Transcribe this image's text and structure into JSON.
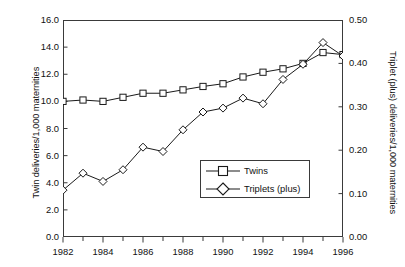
{
  "chart_data": {
    "type": "line",
    "title": "",
    "subtitle": "",
    "xlabel": "",
    "ylabel": "Twin deliveries/1,000 maternities",
    "y2label": "Triplet (plus) deliveries/1,000 maternities",
    "x": [
      1982,
      1983,
      1984,
      1985,
      1986,
      1987,
      1988,
      1989,
      1990,
      1991,
      1992,
      1993,
      1994,
      1995,
      1996
    ],
    "xlim": [
      1982,
      1996
    ],
    "ylim": [
      0.0,
      16.0
    ],
    "y2lim": [
      0.0,
      0.5
    ],
    "grid": false,
    "legend_position": "center-right-inside",
    "x_tick_labels": [
      "1982",
      "1984",
      "1986",
      "1988",
      "1990",
      "1992",
      "1994",
      "1996"
    ],
    "x_tick_values": [
      1982,
      1984,
      1986,
      1988,
      1990,
      1992,
      1994,
      1996
    ],
    "x_minor_tick_values": [
      1983,
      1985,
      1987,
      1989,
      1991,
      1993,
      1995
    ],
    "y_tick_labels": [
      "16.0",
      "14.0",
      "12.0",
      "10.0",
      "8.0",
      "6.0",
      "4.0",
      "2.0",
      "0.0"
    ],
    "y_tick_values": [
      16.0,
      14.0,
      12.0,
      10.0,
      8.0,
      6.0,
      4.0,
      2.0,
      0.0
    ],
    "y2_tick_labels": [
      "0.50",
      "0.40",
      "0.30",
      "0.20",
      "0.10",
      "0.00"
    ],
    "y2_tick_values": [
      0.5,
      0.4,
      0.3,
      0.2,
      0.1,
      0.0
    ],
    "series": [
      {
        "name": "Twins",
        "axis": "left",
        "marker": "square",
        "color": "#1a1a1a",
        "values": [
          10.0,
          10.1,
          10.0,
          10.3,
          10.6,
          10.6,
          10.85,
          11.1,
          11.3,
          11.8,
          12.15,
          12.4,
          12.8,
          13.6,
          13.45
        ]
      },
      {
        "name": "Triplets (plus)",
        "axis": "right",
        "marker": "diamond",
        "color": "#1a1a1a",
        "values": [
          0.108,
          0.147,
          0.128,
          0.155,
          0.207,
          0.197,
          0.247,
          0.288,
          0.297,
          0.32,
          0.307,
          0.363,
          0.398,
          0.448,
          0.417
        ]
      }
    ]
  },
  "legend": {
    "entries": [
      {
        "label": "Twins",
        "marker": "square"
      },
      {
        "label": "Triplets (plus)",
        "marker": "diamond"
      }
    ]
  }
}
